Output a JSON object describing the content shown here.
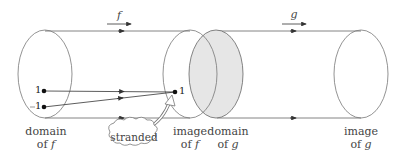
{
  "diagram": {
    "arrows": {
      "f_label": "f",
      "g_label": "g"
    },
    "sets": {
      "domain_f": {
        "line1": "domain",
        "line2": "of",
        "var": "f"
      },
      "image_f": {
        "line1": "image",
        "line2": "of",
        "var": "f"
      },
      "domain_g": {
        "line1": "domain",
        "line2": "of",
        "var": "g",
        "shaded": true,
        "fill": "#e6e6e6"
      },
      "image_g": {
        "line1": "image",
        "line2": "of",
        "var": "g"
      }
    },
    "points": {
      "domain_upper": "1",
      "domain_lower": "1",
      "image_point": "1"
    },
    "callout": {
      "text": "stranded"
    },
    "colors": {
      "stroke": "#555555",
      "shade": "#e6e6e6",
      "text": "#444444"
    }
  }
}
